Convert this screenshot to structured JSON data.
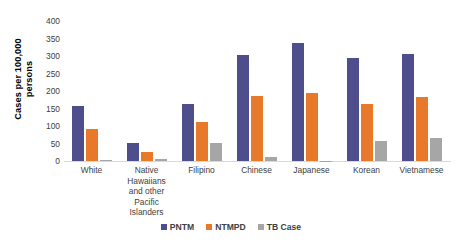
{
  "chart_data": {
    "type": "bar",
    "title": "",
    "xlabel": "",
    "ylabel": "Cases per 100,000 persons",
    "ylim": [
      0,
      400
    ],
    "ytick_step": 50,
    "yticks": [
      400,
      350,
      300,
      250,
      200,
      150,
      100,
      50,
      0
    ],
    "grid": false,
    "legend_position": "bottom",
    "categories": [
      "White",
      "Native Hawaiians and other Pacific Islanders",
      "Filipino",
      "Chinese",
      "Japanese",
      "Korean",
      "Vietnamese"
    ],
    "category_lines": [
      [
        "White"
      ],
      [
        "Native",
        "Hawaiians",
        "and other",
        "Pacific",
        "Islanders"
      ],
      [
        "Filipino"
      ],
      [
        "Chinese"
      ],
      [
        "Japanese"
      ],
      [
        "Korean"
      ],
      [
        "Vietnamese"
      ]
    ],
    "series": [
      {
        "name": "PNTM",
        "color": "#4f4e8c",
        "values": [
          157,
          51,
          163,
          303,
          337,
          295,
          305
        ]
      },
      {
        "name": "NTMPD",
        "color": "#e8792b",
        "values": [
          91,
          26,
          111,
          186,
          194,
          163,
          184
        ]
      },
      {
        "name": "TB Case",
        "color": "#a6a6a6",
        "values": [
          3,
          5,
          52,
          12,
          1,
          57,
          65
        ]
      }
    ]
  },
  "axis": {
    "y_title_line1": "Cases per 100,000",
    "y_title_line2": "persons"
  }
}
